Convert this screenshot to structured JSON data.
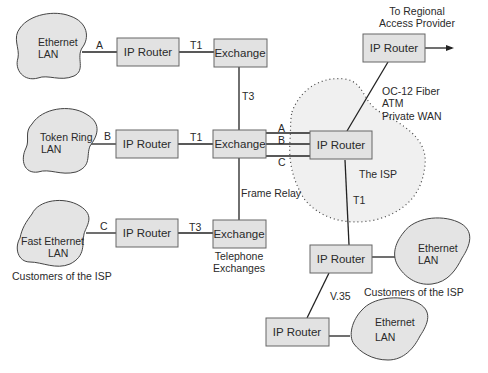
{
  "diagram": {
    "colors": {
      "box_fill": "#e2e2e2",
      "cloud_fill": "#e4e4e4",
      "isp_region_fill": "#f0f0f0",
      "line": "#222222"
    },
    "clouds": {
      "lan_a": {
        "line1": "Ethernet",
        "line2": "LAN"
      },
      "lan_b": {
        "line1": "Token Ring",
        "line2": "LAN"
      },
      "lan_c": {
        "line1": "Fast Ethernet",
        "line2": "LAN"
      },
      "lan_d": {
        "line1": "Ethernet",
        "line2": "LAN"
      },
      "lan_e": {
        "line1": "Ethernet",
        "line2": "LAN"
      }
    },
    "routers": {
      "r_a": "IP Router",
      "r_b": "IP Router",
      "r_c": "IP Router",
      "r_regional": "IP Router",
      "r_isp": "IP Router",
      "r_d": "IP Router",
      "r_e": "IP Router"
    },
    "exchanges": {
      "ex_top": "Exchange",
      "ex_mid": "Exchange",
      "ex_bottom": "Exchange"
    },
    "links": {
      "lan_a": "A",
      "lan_b": "B",
      "lan_c": "C",
      "ra_ex": "T1",
      "rb_ex": "T1",
      "rc_ex": "T3",
      "ex_top_mid": "T3",
      "ex_mid_bottom": "Frame Relay",
      "ex_isp_a": "A",
      "ex_isp_b": "B",
      "ex_isp_c": "C",
      "isp_rd": "T1",
      "rd_re": "V.35"
    },
    "labels": {
      "regional_line1": "To Regional",
      "regional_line2": "Access Provider",
      "oc12_line1": "OC-12 Fiber",
      "oc12_line2": "ATM",
      "oc12_line3": "Private WAN",
      "isp": "The ISP",
      "telephone_line1": "Telephone",
      "telephone_line2": "Exchanges",
      "customers_left": "Customers of the ISP",
      "customers_right": "Customers of the ISP"
    }
  }
}
